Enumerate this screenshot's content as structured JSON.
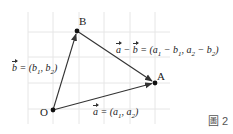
{
  "diagram": {
    "grid": {
      "color": "#e6e6e6",
      "vertical_x": [
        28,
        53,
        79,
        104,
        130,
        155
      ],
      "horizontal_y": [
        32,
        57,
        83,
        109
      ]
    },
    "points": [
      {
        "name": "O",
        "x": 53,
        "y": 110
      },
      {
        "name": "B",
        "x": 77,
        "y": 31
      },
      {
        "name": "A",
        "x": 155,
        "y": 83
      }
    ],
    "vectors": [
      {
        "from": "O",
        "to": "B",
        "label": "b = (b1, b2)"
      },
      {
        "from": "O",
        "to": "A",
        "label": "a = (a1, a2)"
      },
      {
        "from": "B",
        "to": "A",
        "label": "a − b = (a1 − b1, a2 − b2)"
      }
    ],
    "labels": {
      "O": "O",
      "A": "A",
      "B": "B"
    },
    "eq_b": {
      "vec": "b",
      "rest": " = (b",
      "s1": "1",
      "mid": ", b",
      "s2": "2",
      "end": ")"
    },
    "eq_a": {
      "vec": "a",
      "rest": " = (a",
      "s1": "1",
      "mid": ", a",
      "s2": "2",
      "end": ")"
    },
    "eq_diff": {
      "vec1": "a",
      "minus": " − ",
      "vec2": "b",
      "rest": " = (a",
      "s1": "1",
      "m1": " − b",
      "s2": "1",
      "m2": ", a",
      "s3": "2",
      "m3": " − b",
      "s4": "2",
      "end": ")"
    },
    "figure_label": "圖 2",
    "line_color": "#333333",
    "point_color": "#111111"
  }
}
